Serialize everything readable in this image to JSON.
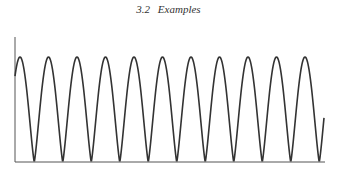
{
  "header": {
    "section_number": "3.2",
    "section_title": "Examples"
  },
  "chart_data": {
    "type": "line",
    "title": "",
    "xlabel": "",
    "ylabel": "",
    "grid": false,
    "legend": null,
    "series": [
      {
        "name": "signal",
        "peaks_x_px": [
          20,
          49,
          78,
          106,
          135,
          163,
          192,
          220,
          248,
          277,
          305
        ],
        "troughs_x_px": [
          34,
          63,
          92,
          120,
          149,
          177,
          206,
          234,
          262,
          291,
          319
        ],
        "period_px": 28.5,
        "min_value": 0,
        "max_value": 1,
        "start_value": 0.5,
        "end_value": 0.3
      }
    ],
    "axis": {
      "x_start_px": 15,
      "x_end_px": 325,
      "y_top_px": 37,
      "baseline_px": 162,
      "peak_px": 57
    },
    "colors": {
      "line": "#333333",
      "axis": "#555555"
    }
  }
}
